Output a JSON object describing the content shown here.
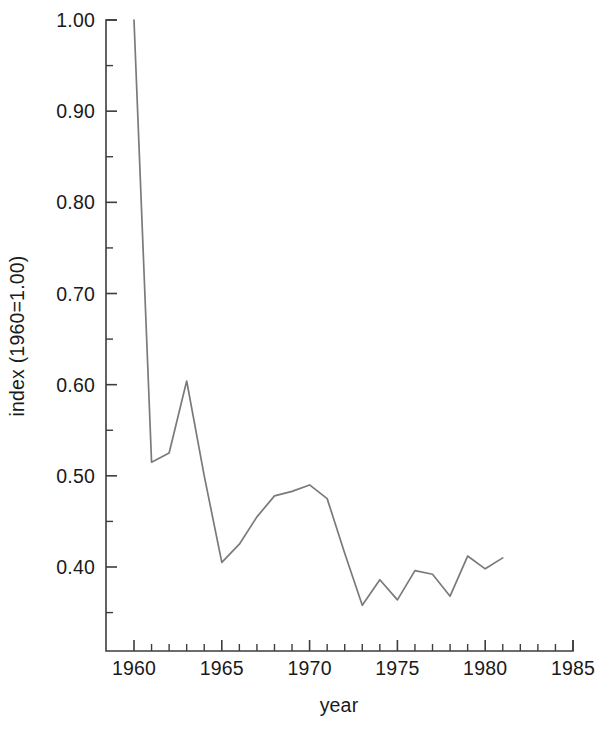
{
  "chart_data": {
    "type": "line",
    "title": "",
    "subtitle": "",
    "xlabel": "year",
    "ylabel": "index (1960=1.00)",
    "xlim": [
      1960,
      1985
    ],
    "ylim": [
      0.3077,
      1.0
    ],
    "grid": false,
    "legend": null,
    "line_color": "#7a7a7a",
    "axis_color": "#3d3d3d",
    "x_ticks": [
      1960,
      1965,
      1970,
      1975,
      1980,
      1985
    ],
    "x_tick_labels": [
      "1960",
      "1965",
      "1970",
      "1975",
      "1980",
      "1985"
    ],
    "x_minor_tick_step": 1,
    "y_ticks": [
      0.4,
      0.5,
      0.6,
      0.7,
      0.8,
      0.9,
      1.0
    ],
    "y_tick_labels": [
      "0.40",
      "0.50",
      "0.60",
      "0.70",
      "0.80",
      "0.90",
      "1.00"
    ],
    "y_minor_tick_step": 0.05,
    "x": [
      1960,
      1961,
      1962,
      1963,
      1964,
      1965,
      1966,
      1967,
      1968,
      1969,
      1970,
      1971,
      1972,
      1973,
      1974,
      1975,
      1976,
      1977,
      1978,
      1979,
      1980,
      1981
    ],
    "values": [
      1.0,
      0.515,
      0.525,
      0.604,
      0.5,
      0.405,
      0.425,
      0.455,
      0.478,
      0.483,
      0.49,
      0.475,
      0.415,
      0.358,
      0.386,
      0.364,
      0.396,
      0.392,
      0.368,
      0.412,
      0.398,
      0.41
    ],
    "series": [
      {
        "name": "index",
        "values": [
          1.0,
          0.515,
          0.525,
          0.604,
          0.5,
          0.405,
          0.425,
          0.455,
          0.478,
          0.483,
          0.49,
          0.475,
          0.415,
          0.358,
          0.386,
          0.364,
          0.396,
          0.392,
          0.368,
          0.412,
          0.398,
          0.41
        ]
      }
    ]
  },
  "geometry": {
    "plot_left": 106,
    "plot_right": 573,
    "plot_top": 20,
    "plot_bottom": 651,
    "x_at_1960": 134,
    "x_at_1985": 573,
    "y_at_1_00": 20,
    "y_at_0_40": 567
  }
}
